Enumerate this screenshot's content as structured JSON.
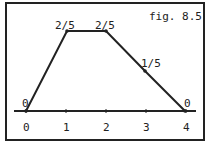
{
  "figure": {
    "caption": "fig. 8.5",
    "axis_ticks": [
      "0",
      "1",
      "2",
      "3",
      "4"
    ],
    "points": [
      {
        "x": 0,
        "label": "0"
      },
      {
        "x": 1,
        "label": "2/5"
      },
      {
        "x": 2,
        "label": "2/5"
      },
      {
        "x": 3,
        "label": "1/5"
      },
      {
        "x": 4,
        "label": "0"
      }
    ],
    "colors": {
      "line": "#222222",
      "background": "#ffffff"
    }
  }
}
